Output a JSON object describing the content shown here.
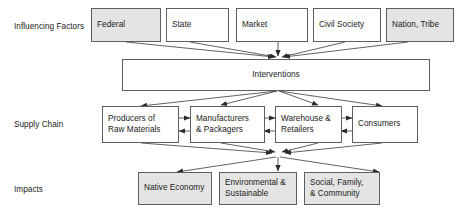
{
  "diagram": {
    "colors": {
      "box_border": "#5f5f5f",
      "box_fill_white": "#ffffff",
      "box_fill_gray": "#e4e4e4",
      "edge": "#3a3a3a",
      "text": "#1a1a1a",
      "background": "#ffffff"
    },
    "row_labels": [
      {
        "id": "influencing-factors",
        "label": "Influencing Factors"
      },
      {
        "id": "supply-chain",
        "label": "Supply Chain"
      },
      {
        "id": "impacts",
        "label": "Impacts"
      }
    ],
    "rows": {
      "influencing_factors": {
        "label": "Influencing Factors",
        "nodes": [
          {
            "id": "federal",
            "label": "Federal",
            "fill": "gray"
          },
          {
            "id": "state",
            "label": "State",
            "fill": "white"
          },
          {
            "id": "market",
            "label": "Market",
            "fill": "white"
          },
          {
            "id": "civil-society",
            "label": "Civil Society",
            "fill": "white"
          },
          {
            "id": "nation-tribe",
            "label": "Nation, Tribe",
            "fill": "gray"
          }
        ]
      },
      "interventions": {
        "nodes": [
          {
            "id": "interventions",
            "label": "Interventions",
            "fill": "white"
          }
        ]
      },
      "supply_chain": {
        "label": "Supply Chain",
        "nodes": [
          {
            "id": "producers",
            "label": "Producers of\nRaw Materials",
            "fill": "white"
          },
          {
            "id": "manufacturers",
            "label": "Manufacturers\n& Packagers",
            "fill": "white"
          },
          {
            "id": "warehouse",
            "label": "Warehouse &\nRetailers",
            "fill": "white"
          },
          {
            "id": "consumers",
            "label": "Consumers",
            "fill": "white"
          }
        ]
      },
      "impacts": {
        "label": "Impacts",
        "nodes": [
          {
            "id": "native-economy",
            "label": "Native Economy",
            "fill": "gray"
          },
          {
            "id": "environmental",
            "label": "Environmental &\nSustainable",
            "fill": "gray"
          },
          {
            "id": "social-family",
            "label": "Social, Family,\n& Community",
            "fill": "gray"
          }
        ]
      }
    },
    "edges": [
      {
        "from": "federal",
        "to": "interventions",
        "kind": "arrow"
      },
      {
        "from": "state",
        "to": "interventions",
        "kind": "arrow"
      },
      {
        "from": "market",
        "to": "interventions",
        "kind": "arrow"
      },
      {
        "from": "civil-society",
        "to": "interventions",
        "kind": "arrow"
      },
      {
        "from": "nation-tribe",
        "to": "interventions",
        "kind": "arrow"
      },
      {
        "from": "interventions",
        "to": "producers",
        "kind": "arrow"
      },
      {
        "from": "interventions",
        "to": "manufacturers",
        "kind": "arrow"
      },
      {
        "from": "interventions",
        "to": "warehouse",
        "kind": "arrow"
      },
      {
        "from": "interventions",
        "to": "consumers",
        "kind": "arrow"
      },
      {
        "from": "producers",
        "to": "manufacturers",
        "kind": "bidirectional"
      },
      {
        "from": "manufacturers",
        "to": "warehouse",
        "kind": "bidirectional"
      },
      {
        "from": "warehouse",
        "to": "consumers",
        "kind": "bidirectional"
      },
      {
        "from": "producers",
        "to": "impacts-hub",
        "kind": "arrow"
      },
      {
        "from": "manufacturers",
        "to": "impacts-hub",
        "kind": "arrow"
      },
      {
        "from": "warehouse",
        "to": "impacts-hub",
        "kind": "arrow"
      },
      {
        "from": "consumers",
        "to": "impacts-hub",
        "kind": "arrow"
      },
      {
        "from": "impacts-hub",
        "to": "native-economy",
        "kind": "arrow"
      },
      {
        "from": "impacts-hub",
        "to": "environmental",
        "kind": "arrow"
      },
      {
        "from": "impacts-hub",
        "to": "social-family",
        "kind": "arrow"
      }
    ]
  }
}
